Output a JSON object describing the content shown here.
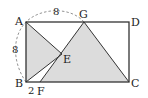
{
  "diagram": {
    "points": {
      "A": {
        "label": "A",
        "x": 26,
        "y": 22
      },
      "B": {
        "label": "B",
        "x": 26,
        "y": 82
      },
      "C": {
        "label": "C",
        "x": 129,
        "y": 82
      },
      "D": {
        "label": "D",
        "x": 129,
        "y": 22
      },
      "E": {
        "label": "E",
        "x": 62,
        "y": 54
      },
      "F": {
        "label": "F",
        "x": 40,
        "y": 82
      },
      "G": {
        "label": "G",
        "x": 84,
        "y": 22
      }
    },
    "measurements": {
      "AB": "8",
      "AG": "8",
      "BF": "2"
    },
    "colors": {
      "shade": "#dcdcdc",
      "line": "#333333",
      "dashed": "#888888"
    }
  }
}
